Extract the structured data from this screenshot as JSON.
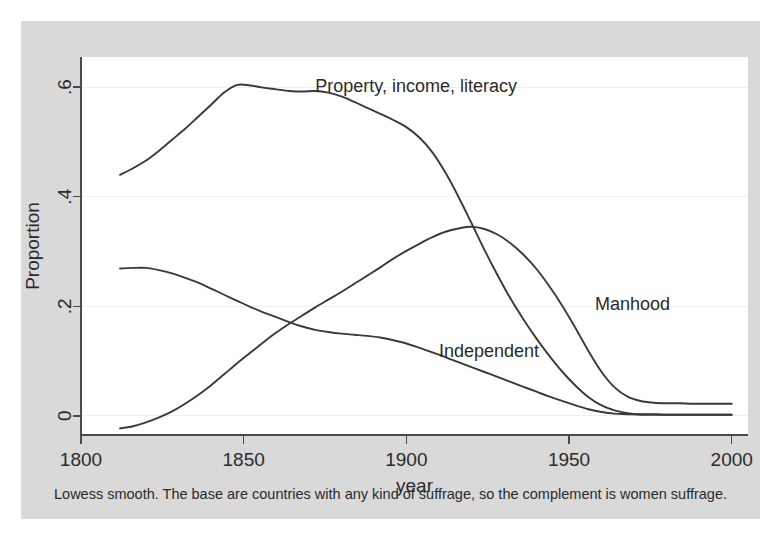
{
  "figure": {
    "background_color": "#d9d9d9",
    "plot_background_color": "#ffffff",
    "line_color": "#3a3a3a",
    "grid_color": "#efefef",
    "axis_color": "#4a4a4a",
    "note": "Lowess smooth. The base are countries with any kind of suffrage, so the complement is women suffrage."
  },
  "chart_data": {
    "type": "line",
    "title": "",
    "xlabel": "year",
    "ylabel": "Proportion",
    "xlim": [
      1800,
      2005
    ],
    "ylim": [
      -0.035,
      0.655
    ],
    "xticks": [
      1800,
      1850,
      1900,
      1950,
      2000
    ],
    "xtick_labels": [
      "1800",
      "1850",
      "1900",
      "1950",
      "2000"
    ],
    "yticks": [
      0,
      0.2,
      0.4,
      0.6
    ],
    "ytick_labels": [
      "0",
      ".2",
      ".4",
      ".6"
    ],
    "grid": "horizontal",
    "legend_position": "inline-annotations",
    "annotations": [
      {
        "text": "Property, income, literacy",
        "x": 1872,
        "y": 0.602,
        "anchor": "start"
      },
      {
        "text": "Manhood",
        "x": 1958,
        "y": 0.205,
        "anchor": "start"
      },
      {
        "text": "Independent",
        "x": 1910,
        "y": 0.118,
        "anchor": "start"
      }
    ],
    "series": [
      {
        "name": "Property, income, literacy",
        "x": [
          1812,
          1816,
          1820,
          1824,
          1828,
          1832,
          1836,
          1840,
          1844,
          1848,
          1852,
          1856,
          1860,
          1864,
          1868,
          1872,
          1876,
          1880,
          1884,
          1888,
          1892,
          1896,
          1900,
          1904,
          1908,
          1912,
          1916,
          1920,
          1924,
          1928,
          1932,
          1936,
          1940,
          1944,
          1948,
          1952,
          1956,
          1960,
          1964,
          1968,
          1972,
          1976,
          1980,
          1984,
          1988,
          1992,
          1996,
          2000
        ],
        "y": [
          0.44,
          0.452,
          0.466,
          0.484,
          0.504,
          0.524,
          0.546,
          0.568,
          0.59,
          0.604,
          0.603,
          0.599,
          0.596,
          0.593,
          0.592,
          0.593,
          0.59,
          0.583,
          0.573,
          0.562,
          0.551,
          0.54,
          0.527,
          0.508,
          0.481,
          0.444,
          0.4,
          0.352,
          0.303,
          0.257,
          0.214,
          0.176,
          0.141,
          0.109,
          0.08,
          0.055,
          0.034,
          0.019,
          0.01,
          0.005,
          0.003,
          0.003,
          0.002,
          0.002,
          0.002,
          0.002,
          0.002,
          0.002
        ]
      },
      {
        "name": "Independent",
        "x": [
          1812,
          1816,
          1820,
          1824,
          1828,
          1832,
          1836,
          1840,
          1844,
          1848,
          1852,
          1856,
          1860,
          1864,
          1868,
          1872,
          1876,
          1880,
          1884,
          1888,
          1892,
          1896,
          1900,
          1904,
          1908,
          1912,
          1916,
          1920,
          1924,
          1928,
          1932,
          1936,
          1940,
          1944,
          1948,
          1952,
          1956,
          1960,
          1964,
          1968,
          1972,
          1976,
          1980,
          1984,
          1988,
          1992,
          1996,
          2000
        ],
        "y": [
          0.269,
          0.27,
          0.27,
          0.266,
          0.26,
          0.252,
          0.243,
          0.232,
          0.221,
          0.21,
          0.199,
          0.189,
          0.18,
          0.171,
          0.163,
          0.157,
          0.153,
          0.15,
          0.148,
          0.146,
          0.143,
          0.138,
          0.132,
          0.124,
          0.116,
          0.107,
          0.098,
          0.089,
          0.08,
          0.071,
          0.062,
          0.053,
          0.044,
          0.035,
          0.027,
          0.019,
          0.012,
          0.007,
          0.004,
          0.003,
          0.002,
          0.002,
          0.002,
          0.002,
          0.002,
          0.002,
          0.002,
          0.002
        ]
      },
      {
        "name": "Manhood",
        "x": [
          1812,
          1816,
          1820,
          1824,
          1828,
          1832,
          1836,
          1840,
          1844,
          1848,
          1852,
          1856,
          1860,
          1864,
          1868,
          1872,
          1876,
          1880,
          1884,
          1888,
          1892,
          1896,
          1900,
          1904,
          1908,
          1912,
          1916,
          1920,
          1924,
          1928,
          1932,
          1936,
          1940,
          1944,
          1948,
          1952,
          1956,
          1960,
          1964,
          1968,
          1972,
          1976,
          1980,
          1984,
          1988,
          1992,
          1996,
          2000
        ],
        "y": [
          -0.023,
          -0.019,
          -0.012,
          -0.003,
          0.008,
          0.022,
          0.038,
          0.056,
          0.076,
          0.096,
          0.115,
          0.134,
          0.152,
          0.168,
          0.183,
          0.198,
          0.212,
          0.226,
          0.241,
          0.256,
          0.271,
          0.287,
          0.301,
          0.314,
          0.326,
          0.336,
          0.342,
          0.345,
          0.341,
          0.331,
          0.315,
          0.294,
          0.268,
          0.236,
          0.2,
          0.16,
          0.118,
          0.08,
          0.052,
          0.035,
          0.027,
          0.024,
          0.023,
          0.023,
          0.022,
          0.022,
          0.022,
          0.022
        ]
      }
    ]
  }
}
